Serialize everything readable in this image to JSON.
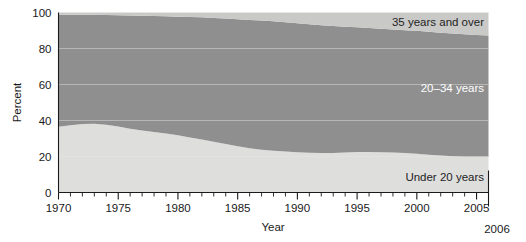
{
  "chart_data": {
    "type": "area",
    "title": "",
    "subtitle": "",
    "xlabel": "Year",
    "ylabel": "Percent",
    "xlim": [
      1970,
      2006
    ],
    "ylim": [
      0,
      100
    ],
    "grid": true,
    "stacked": true,
    "legend_position": "inline-right",
    "x": [
      1970,
      1971,
      1972,
      1973,
      1974,
      1975,
      1976,
      1977,
      1978,
      1979,
      1980,
      1981,
      1982,
      1983,
      1984,
      1985,
      1986,
      1987,
      1988,
      1989,
      1990,
      1991,
      1992,
      1993,
      1994,
      1995,
      1996,
      1997,
      1998,
      1999,
      2000,
      2001,
      2002,
      2003,
      2004,
      2005,
      2006
    ],
    "xticks": [
      1970,
      1975,
      1980,
      1985,
      1990,
      1995,
      2000,
      2005
    ],
    "xticklabels": [
      "1970",
      "1975",
      "1980",
      "1985",
      "1990",
      "1995",
      "2000",
      "2005"
    ],
    "xtick_minor_step": 1,
    "yticks": [
      0,
      20,
      40,
      60,
      80,
      100
    ],
    "yticklabels": [
      "0",
      "20",
      "40",
      "60",
      "80",
      "100"
    ],
    "end_label": "2006",
    "series": [
      {
        "name": "Under 20 years",
        "color": "#dededd",
        "label_color": "#1f1f1f",
        "values": [
          36.5,
          37.3,
          38.1,
          38.2,
          37.6,
          36.6,
          35.4,
          34.4,
          33.6,
          32.8,
          31.8,
          30.6,
          29.4,
          28.2,
          27.0,
          25.7,
          24.6,
          23.8,
          23.2,
          22.8,
          22.3,
          22.1,
          21.9,
          22.0,
          22.2,
          22.5,
          22.5,
          22.4,
          22.2,
          21.9,
          21.5,
          21.0,
          20.5,
          20.1,
          19.9,
          19.8,
          19.8
        ]
      },
      {
        "name": "20–34 years",
        "color": "#8f8f8f",
        "label_color": "#ffffff",
        "values": [
          62.2,
          61.4,
          60.6,
          60.5,
          61.0,
          61.9,
          62.9,
          63.8,
          64.5,
          65.1,
          65.9,
          66.9,
          67.9,
          68.8,
          69.7,
          70.6,
          71.3,
          71.7,
          71.9,
          71.8,
          71.7,
          71.4,
          71.0,
          70.5,
          69.9,
          69.3,
          68.9,
          68.6,
          68.4,
          68.3,
          68.3,
          68.3,
          68.3,
          68.2,
          68.0,
          67.7,
          67.4
        ]
      },
      {
        "name": "35 years and over",
        "color": "#c9c9c8",
        "label_color": "#1f1f1f",
        "values": [
          1.3,
          1.3,
          1.3,
          1.3,
          1.4,
          1.5,
          1.7,
          1.8,
          1.9,
          2.1,
          2.3,
          2.5,
          2.7,
          3.0,
          3.3,
          3.7,
          4.1,
          4.5,
          4.9,
          5.4,
          6.0,
          6.5,
          7.1,
          7.5,
          7.9,
          8.2,
          8.6,
          9.0,
          9.4,
          9.8,
          10.2,
          10.7,
          11.2,
          11.7,
          12.1,
          12.5,
          12.8
        ]
      }
    ]
  },
  "axes": {
    "y_title": "Percent",
    "x_title": "Year"
  },
  "labels": {
    "top_band": "35 years and over",
    "middle_band": "20–34 years",
    "bottom_band": "Under 20 years",
    "end_year": "2006"
  },
  "colors": {
    "under20": "#dededd",
    "age20to34": "#8f8f8f",
    "age35plus": "#c9c9c8",
    "axis": "#1a1a1a",
    "gridline": "#e9e9e9",
    "background": "#ffffff"
  }
}
